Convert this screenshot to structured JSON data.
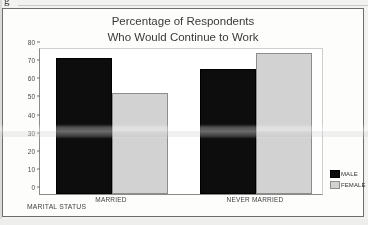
{
  "page": {
    "stray_mark": "g"
  },
  "chart": {
    "title_line1": "Percentage of Respondents",
    "title_line2": "Who Would Continue to Work",
    "xaxis_title": "MARITAL STATUS",
    "legend": [
      {
        "label": "MALE",
        "color": "#0d0d0d"
      },
      {
        "label": "FEMALE",
        "color": "#d2d2d2"
      }
    ]
  },
  "chart_data": {
    "type": "bar",
    "title": "Percentage of Respondents Who Would Continue to Work",
    "xlabel": "MARITAL STATUS",
    "ylabel": "",
    "categories": [
      "MARRIED",
      "NEVER MARRIED"
    ],
    "series": [
      {
        "name": "MALE",
        "color": "#0d0d0d",
        "values": [
          75,
          69
        ]
      },
      {
        "name": "FEMALE",
        "color": "#d2d2d2",
        "values": [
          56,
          78
        ]
      }
    ],
    "ylim": [
      0,
      80
    ],
    "yticks": [
      0,
      10,
      20,
      30,
      40,
      50,
      60,
      70,
      80
    ],
    "ytick_labels": [
      "0",
      "10",
      "20",
      "30",
      "40",
      "50",
      "60",
      "70",
      "80"
    ],
    "grid": false,
    "legend_position": "right-bottom"
  }
}
